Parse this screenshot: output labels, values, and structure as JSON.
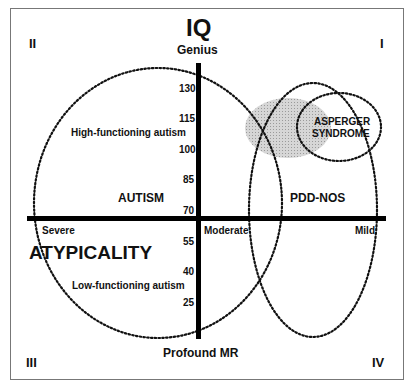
{
  "title": "IQ",
  "axis": {
    "top_label": "Genius",
    "bottom_label": "Profound MR",
    "horizontal_label": "ATYPICALITY",
    "horizontal_ticks": [
      "Severe",
      "Moderate",
      "Mild"
    ],
    "iq_ticks": [
      "130",
      "115",
      "100",
      "85",
      "70",
      "55",
      "40",
      "25"
    ]
  },
  "quadrants": {
    "q1": "I",
    "q2": "II",
    "q3": "III",
    "q4": "IV"
  },
  "regions": {
    "autism": "AUTISM",
    "high_functioning": "High-functioning autism",
    "low_functioning": "Low-functioning autism",
    "pdd_nos": "PDD-NOS",
    "asperger_line1": "ASPERGER",
    "asperger_line2": "SYNDROME"
  },
  "colors": {
    "axis": "#000000",
    "ellipse": "#111111",
    "shaded": "#c8c8c8",
    "frame": "#777777"
  }
}
